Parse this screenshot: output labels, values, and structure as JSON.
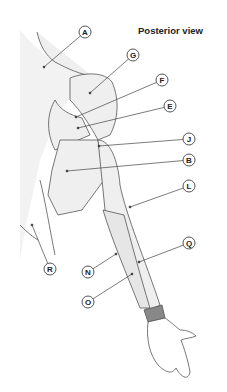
{
  "title": "Posterior view",
  "colors": {
    "line": "#444444",
    "fill": "#eeeeee",
    "background": "#ffffff"
  },
  "labels": [
    {
      "id": "A",
      "x": 85,
      "y": 32,
      "tx": 44,
      "ty": 67
    },
    {
      "id": "G",
      "x": 133,
      "y": 55,
      "tx": 90,
      "ty": 93
    },
    {
      "id": "F",
      "x": 162,
      "y": 80,
      "tx": 76,
      "ty": 117
    },
    {
      "id": "E",
      "x": 170,
      "y": 106,
      "tx": 78,
      "ty": 128
    },
    {
      "id": "J",
      "x": 189,
      "y": 139,
      "tx": 99,
      "ty": 146
    },
    {
      "id": "B",
      "x": 189,
      "y": 160,
      "tx": 67,
      "ty": 171
    },
    {
      "id": "L",
      "x": 189,
      "y": 186,
      "tx": 130,
      "ty": 207
    },
    {
      "id": "Q",
      "x": 189,
      "y": 243,
      "tx": 139,
      "ty": 262
    },
    {
      "id": "R",
      "x": 50,
      "y": 269,
      "tx": 32,
      "ty": 225
    },
    {
      "id": "N",
      "x": 88,
      "y": 272,
      "tx": 116,
      "ty": 254
    },
    {
      "id": "O",
      "x": 88,
      "y": 302,
      "tx": 132,
      "ty": 274
    }
  ]
}
